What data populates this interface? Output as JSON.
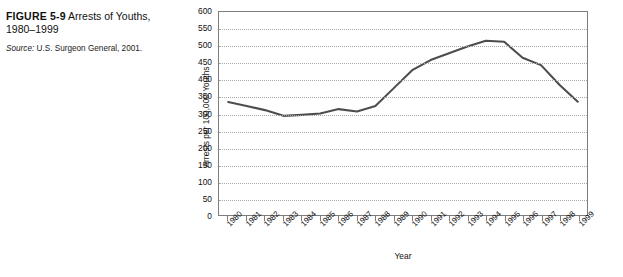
{
  "caption": {
    "figure_number": "FIGURE 5-9",
    "title": "Arrests of Youths, 1980–1999",
    "source_label": "Source:",
    "source_text": "U.S. Surgeon General, 2001."
  },
  "colors": {
    "line": "#4d4d4d",
    "frame": "#7d7d7d",
    "grid": "#a8a8a8",
    "text": "#111111",
    "background": "#ffffff"
  },
  "chart_data": {
    "type": "line",
    "title": "Arrests of Youths, 1980–1999",
    "xlabel": "Year",
    "ylabel": "Arrests per 100,000 Youths",
    "categories": [
      "1980",
      "1981",
      "1982",
      "1983",
      "1984",
      "1985",
      "1986",
      "1987",
      "1988",
      "1989",
      "1990",
      "1991",
      "1992",
      "1993",
      "1994",
      "1995",
      "1996",
      "1997",
      "1998",
      "1999"
    ],
    "values": [
      334,
      322,
      310,
      293,
      296,
      300,
      313,
      306,
      322,
      375,
      428,
      458,
      478,
      498,
      515,
      512,
      465,
      443,
      385,
      335
    ],
    "ylim": [
      0,
      600
    ],
    "yticks": [
      0,
      50,
      100,
      150,
      200,
      250,
      300,
      350,
      400,
      450,
      500,
      550,
      600
    ],
    "ytick_labels": [
      "0",
      "50",
      "100",
      "150",
      "200",
      "250",
      "300",
      "350",
      "400",
      "450",
      "500",
      "550",
      "600"
    ],
    "grid": true,
    "legend": false,
    "legend_position": "none",
    "series": [
      {
        "name": "Arrests per 100,000 Youths",
        "values": [
          334,
          322,
          310,
          293,
          296,
          300,
          313,
          306,
          322,
          375,
          428,
          458,
          478,
          498,
          515,
          512,
          465,
          443,
          385,
          335
        ]
      }
    ]
  }
}
